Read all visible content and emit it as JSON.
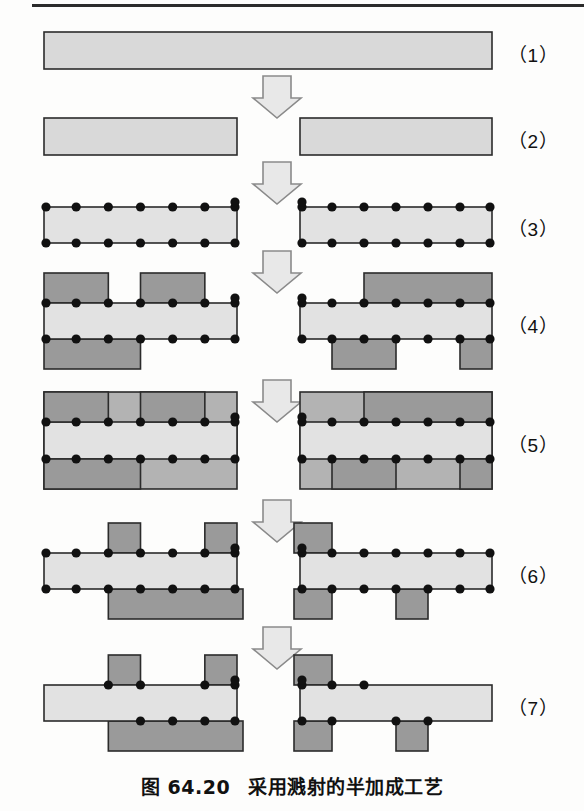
{
  "figure": {
    "caption_number": "图 64.20",
    "caption_text": "采用溅射的半加成工艺",
    "step_labels": [
      "（1）",
      "（2）",
      "（3）",
      "（4）",
      "（5）",
      "（6）",
      "（7）"
    ],
    "colors": {
      "substrate": "#d9d9d9",
      "substrate_light": "#e2e2e2",
      "resist": "#9a9a9a",
      "plating": "#b3b3b3",
      "outline": "#2b2b2b",
      "seed_dot": "#111111",
      "arrow_fill": "#e8e8e8",
      "arrow_stroke": "#8a8a8a",
      "page_background": "#fdfdfc"
    },
    "steps": [
      {
        "index": 1,
        "label": "（1）",
        "description": "base laminate panel",
        "blocks": [
          {
            "x": 44,
            "y": 32,
            "w": 448,
            "h": 37,
            "fill": "substrate",
            "dots": false
          }
        ]
      },
      {
        "index": 2,
        "label": "（2）",
        "description": "panel separated into two sections",
        "blocks": [
          {
            "x": 44,
            "y": 118,
            "w": 193,
            "h": 37,
            "fill": "substrate",
            "dots": false
          },
          {
            "x": 300,
            "y": 118,
            "w": 192,
            "h": 37,
            "fill": "substrate",
            "dots": false
          }
        ]
      },
      {
        "index": 3,
        "label": "（3）",
        "description": "sputtered seed layer on both faces",
        "blocks": [
          {
            "x": 44,
            "y": 207,
            "w": 193,
            "h": 36,
            "fill": "substrate",
            "dots": true,
            "dot_count": 7
          },
          {
            "x": 300,
            "y": 207,
            "w": 192,
            "h": 36,
            "fill": "substrate",
            "dots": true,
            "dot_count": 7
          }
        ]
      },
      {
        "index": 4,
        "label": "（4）",
        "description": "photoresist imaged on both faces",
        "blocks": [
          {
            "x": 44,
            "y": 303,
            "w": 193,
            "h": 36,
            "fill": "substrate",
            "dots": true,
            "dot_count": 7
          },
          {
            "x": 300,
            "y": 303,
            "w": 192,
            "h": 36,
            "fill": "substrate",
            "dots": true,
            "dot_count": 7
          }
        ],
        "resist_top_left": [
          [
            0,
            2
          ],
          [
            3,
            5
          ]
        ],
        "resist_bottom_left": [
          [
            0,
            3
          ]
        ],
        "resist_top_right": [
          [
            2,
            6
          ]
        ],
        "resist_bottom_right": [
          [
            1,
            3
          ],
          [
            5,
            6
          ]
        ]
      },
      {
        "index": 5,
        "label": "（5）",
        "description": "copper pattern plated into resist openings",
        "blocks": [
          {
            "x": 44,
            "y": 422,
            "w": 193,
            "h": 37,
            "fill": "substrate",
            "dots": true,
            "dot_count": 7
          },
          {
            "x": 300,
            "y": 422,
            "w": 192,
            "h": 37,
            "fill": "substrate",
            "dots": true,
            "dot_count": 7
          }
        ]
      },
      {
        "index": 6,
        "label": "（6）",
        "description": "resist stripped, plated copper remains",
        "blocks": [
          {
            "x": 44,
            "y": 553,
            "w": 193,
            "h": 36,
            "fill": "substrate",
            "dots": true,
            "dot_count": 7
          },
          {
            "x": 300,
            "y": 553,
            "w": 192,
            "h": 36,
            "fill": "substrate",
            "dots": true,
            "dot_count": 7
          }
        ],
        "plate_top_left": [
          [
            2,
            3
          ],
          [
            5,
            6
          ]
        ],
        "plate_bottom_left": [
          [
            2,
            6
          ]
        ],
        "plate_top_right": [
          [
            0,
            1
          ]
        ],
        "plate_bottom_right": [
          [
            0,
            1
          ],
          [
            3,
            4
          ]
        ]
      },
      {
        "index": 7,
        "label": "（7）",
        "description": "seed layer flash-etched, final circuit traces",
        "blocks": [
          {
            "x": 44,
            "y": 685,
            "w": 193,
            "h": 36,
            "fill": "substrate",
            "dots": true,
            "dot_count": 7
          },
          {
            "x": 300,
            "y": 685,
            "w": 192,
            "h": 36,
            "fill": "substrate",
            "dots": true,
            "dot_count": 7
          }
        ]
      }
    ],
    "arrows": [
      {
        "index": 1,
        "cx": 277,
        "y": 76,
        "between": "1-2"
      },
      {
        "index": 2,
        "cx": 277,
        "y": 162,
        "between": "2-3"
      },
      {
        "index": 3,
        "cx": 277,
        "y": 251,
        "between": "3-4"
      },
      {
        "index": 4,
        "cx": 277,
        "y": 380,
        "between": "4-5"
      },
      {
        "index": 5,
        "cx": 277,
        "y": 500,
        "between": "5-6"
      },
      {
        "index": 6,
        "cx": 277,
        "y": 627,
        "between": "6-7"
      }
    ],
    "label_positions": [
      {
        "index": 1,
        "x": 508,
        "y": 40
      },
      {
        "index": 2,
        "x": 508,
        "y": 126
      },
      {
        "index": 3,
        "x": 508,
        "y": 214
      },
      {
        "index": 4,
        "x": 508,
        "y": 311
      },
      {
        "index": 5,
        "x": 508,
        "y": 430
      },
      {
        "index": 6,
        "x": 508,
        "y": 561
      },
      {
        "index": 7,
        "x": 508,
        "y": 693
      }
    ]
  }
}
